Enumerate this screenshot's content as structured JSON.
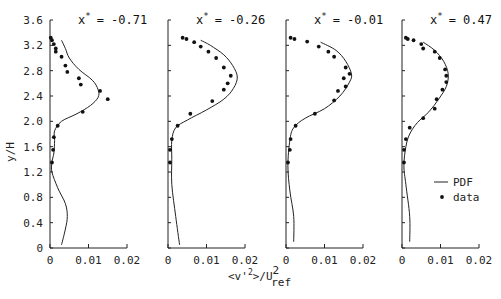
{
  "chart_data": {
    "type": "line",
    "ylabel": "y/H",
    "xlabel": "<v'2>/U2ref",
    "xlabel_parts": {
      "main": "<v'",
      "sup1": "2",
      "mid": ">/U",
      "sup2": "2",
      "sub": "ref"
    },
    "yticks": [
      "0",
      "0.4",
      "0.8",
      "1.2",
      "1.6",
      "2.0",
      "2.4",
      "2.8",
      "3.2",
      "3.6"
    ],
    "xticks": [
      "0",
      "0.01",
      "0.02"
    ],
    "ylim": [
      0,
      3.6
    ],
    "xlim": [
      0,
      0.02
    ],
    "legend": [
      {
        "label": "PDF",
        "style": "line"
      },
      {
        "label": "data",
        "style": "marker"
      }
    ],
    "panels": [
      {
        "title": "x* = -0.71",
        "title_prefix": "x",
        "title_value": "= -0.71",
        "pdf": [
          [
            0.003,
            0.05
          ],
          [
            0.004,
            0.3
          ],
          [
            0.0045,
            0.5
          ],
          [
            0.004,
            0.7
          ],
          [
            0.002,
            0.95
          ],
          [
            0.0005,
            1.2
          ],
          [
            0.0005,
            1.35
          ],
          [
            0.001,
            1.5
          ],
          [
            0.0012,
            1.7
          ],
          [
            0.0012,
            1.85
          ],
          [
            0.003,
            2.0
          ],
          [
            0.007,
            2.12
          ],
          [
            0.0105,
            2.25
          ],
          [
            0.0125,
            2.38
          ],
          [
            0.0125,
            2.5
          ],
          [
            0.011,
            2.65
          ],
          [
            0.0075,
            2.82
          ],
          [
            0.005,
            3.0
          ],
          [
            0.004,
            3.15
          ],
          [
            0.003,
            3.28
          ]
        ],
        "data": [
          [
            0.0005,
            1.35
          ],
          [
            0.0008,
            1.55
          ],
          [
            0.001,
            1.75
          ],
          [
            0.002,
            1.93
          ],
          [
            0.0085,
            2.15
          ],
          [
            0.015,
            2.35
          ],
          [
            0.013,
            2.48
          ],
          [
            0.008,
            2.58
          ],
          [
            0.0075,
            2.68
          ],
          [
            0.0045,
            2.78
          ],
          [
            0.004,
            2.88
          ],
          [
            0.003,
            3.02
          ],
          [
            0.0015,
            3.1
          ],
          [
            0.0015,
            3.15
          ],
          [
            0.001,
            3.22
          ],
          [
            0.0005,
            3.28
          ],
          [
            0.0002,
            3.32
          ]
        ]
      },
      {
        "title": "x* = -0.26",
        "title_prefix": "x",
        "title_value": "= -0.26",
        "pdf": [
          [
            0.003,
            0.05
          ],
          [
            0.002,
            0.5
          ],
          [
            0.001,
            1.0
          ],
          [
            0.001,
            1.4
          ],
          [
            0.001,
            1.7
          ],
          [
            0.002,
            1.9
          ],
          [
            0.005,
            2.02
          ],
          [
            0.01,
            2.18
          ],
          [
            0.0145,
            2.35
          ],
          [
            0.017,
            2.52
          ],
          [
            0.018,
            2.7
          ],
          [
            0.0168,
            2.88
          ],
          [
            0.0145,
            3.05
          ],
          [
            0.011,
            3.2
          ],
          [
            0.0085,
            3.28
          ]
        ],
        "data": [
          [
            0.0005,
            1.35
          ],
          [
            0.0005,
            1.55
          ],
          [
            0.001,
            1.72
          ],
          [
            0.0025,
            1.93
          ],
          [
            0.0058,
            2.12
          ],
          [
            0.0115,
            2.32
          ],
          [
            0.0145,
            2.5
          ],
          [
            0.0155,
            2.6
          ],
          [
            0.0163,
            2.72
          ],
          [
            0.0145,
            2.85
          ],
          [
            0.0125,
            3.0
          ],
          [
            0.0105,
            3.1
          ],
          [
            0.0085,
            3.18
          ],
          [
            0.0068,
            3.25
          ],
          [
            0.0048,
            3.3
          ],
          [
            0.0038,
            3.32
          ]
        ]
      },
      {
        "title": "x* = -0.01",
        "title_prefix": "x",
        "title_value": "= -0.01",
        "pdf": [
          [
            0.002,
            0.1
          ],
          [
            0.002,
            0.5
          ],
          [
            0.001,
            0.9
          ],
          [
            0.0005,
            1.3
          ],
          [
            0.001,
            1.7
          ],
          [
            0.002,
            1.9
          ],
          [
            0.005,
            2.05
          ],
          [
            0.01,
            2.2
          ],
          [
            0.014,
            2.4
          ],
          [
            0.0165,
            2.62
          ],
          [
            0.017,
            2.75
          ],
          [
            0.0155,
            2.95
          ],
          [
            0.013,
            3.12
          ],
          [
            0.009,
            3.25
          ]
        ],
        "data": [
          [
            0.0005,
            1.35
          ],
          [
            0.001,
            1.55
          ],
          [
            0.0012,
            1.72
          ],
          [
            0.0025,
            1.93
          ],
          [
            0.0075,
            2.12
          ],
          [
            0.0125,
            2.33
          ],
          [
            0.0135,
            2.48
          ],
          [
            0.0155,
            2.55
          ],
          [
            0.015,
            2.68
          ],
          [
            0.0165,
            2.75
          ],
          [
            0.0155,
            2.85
          ],
          [
            0.0125,
            3.02
          ],
          [
            0.011,
            3.1
          ],
          [
            0.0085,
            3.18
          ],
          [
            0.0055,
            3.26
          ],
          [
            0.0022,
            3.3
          ],
          [
            0.0012,
            3.32
          ]
        ]
      },
      {
        "title": "x* = 0.47",
        "title_prefix": "x",
        "title_value": "= 0.47",
        "pdf": [
          [
            0.002,
            0.1
          ],
          [
            0.002,
            0.5
          ],
          [
            0.001,
            1.0
          ],
          [
            0.0005,
            1.3
          ],
          [
            0.001,
            1.6
          ],
          [
            0.002,
            1.8
          ],
          [
            0.004,
            1.98
          ],
          [
            0.007,
            2.15
          ],
          [
            0.0095,
            2.35
          ],
          [
            0.0115,
            2.55
          ],
          [
            0.012,
            2.75
          ],
          [
            0.0108,
            2.95
          ],
          [
            0.0085,
            3.12
          ],
          [
            0.0055,
            3.25
          ]
        ],
        "data": [
          [
            0.0005,
            1.35
          ],
          [
            0.0005,
            1.55
          ],
          [
            0.001,
            1.72
          ],
          [
            0.002,
            1.9
          ],
          [
            0.0055,
            2.05
          ],
          [
            0.0085,
            2.2
          ],
          [
            0.009,
            2.35
          ],
          [
            0.0105,
            2.5
          ],
          [
            0.0115,
            2.62
          ],
          [
            0.0115,
            2.72
          ],
          [
            0.0112,
            2.82
          ],
          [
            0.0098,
            3.0
          ],
          [
            0.0085,
            3.1
          ],
          [
            0.0055,
            3.15
          ],
          [
            0.005,
            3.22
          ],
          [
            0.003,
            3.28
          ],
          [
            0.0015,
            3.3
          ],
          [
            0.001,
            3.32
          ]
        ]
      }
    ]
  }
}
